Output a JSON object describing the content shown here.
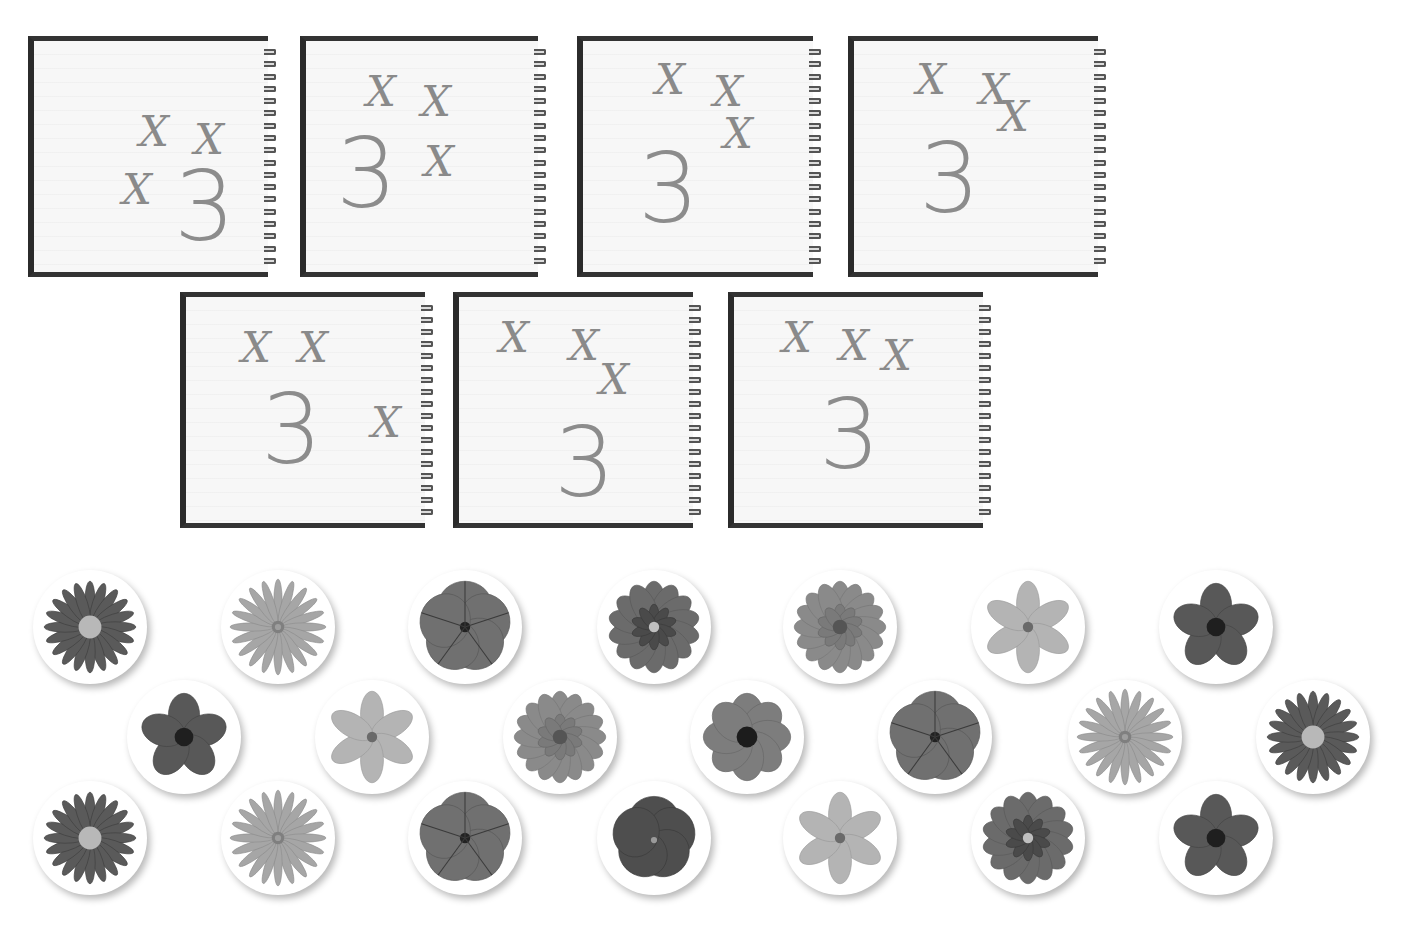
{
  "notebooks": [
    {
      "id": 1,
      "tally": 3,
      "number": "3",
      "marks": [
        {
          "x": 105,
          "y": 70
        },
        {
          "x": 160,
          "y": 78
        },
        {
          "x": 88,
          "y": 128
        }
      ],
      "three": {
        "x": 140,
        "y": 118
      }
    },
    {
      "id": 2,
      "tally": 3,
      "number": "3",
      "marks": [
        {
          "x": 60,
          "y": 30
        },
        {
          "x": 115,
          "y": 40
        },
        {
          "x": 118,
          "y": 100
        }
      ],
      "three": {
        "x": 30,
        "y": 85
      }
    },
    {
      "id": 3,
      "tally": 3,
      "number": "3",
      "marks": [
        {
          "x": 72,
          "y": 18
        },
        {
          "x": 130,
          "y": 30
        },
        {
          "x": 140,
          "y": 72
        }
      ],
      "three": {
        "x": 55,
        "y": 100
      }
    },
    {
      "id": 4,
      "tally": 3,
      "number": "3",
      "marks": [
        {
          "x": 62,
          "y": 18
        },
        {
          "x": 125,
          "y": 28
        },
        {
          "x": 145,
          "y": 55
        }
      ],
      "three": {
        "x": 65,
        "y": 90
      }
    },
    {
      "id": 5,
      "tally": 3,
      "number": "3",
      "marks": [
        {
          "x": 55,
          "y": 30
        },
        {
          "x": 112,
          "y": 30
        },
        {
          "x": 185,
          "y": 105
        }
      ],
      "three": {
        "x": 75,
        "y": 85
      }
    },
    {
      "id": 6,
      "tally": 3,
      "number": "3",
      "marks": [
        {
          "x": 40,
          "y": 20
        },
        {
          "x": 110,
          "y": 28
        },
        {
          "x": 140,
          "y": 62
        }
      ],
      "three": {
        "x": 95,
        "y": 118
      }
    },
    {
      "id": 7,
      "tally": 3,
      "number": "3",
      "marks": [
        {
          "x": 48,
          "y": 20
        },
        {
          "x": 105,
          "y": 28
        },
        {
          "x": 148,
          "y": 38
        }
      ],
      "three": {
        "x": 85,
        "y": 90
      }
    }
  ],
  "flowers": {
    "count": 21,
    "rows": [
      [
        "gerbera-dark",
        "daisy-light",
        "petunia",
        "dahlia",
        "zinnia",
        "star-flower-light",
        "anemone-dark"
      ],
      [
        "anemone-dark",
        "star-flower-light",
        "zinnia",
        "anemone-centered",
        "petunia",
        "daisy-light",
        "gerbera-dark"
      ],
      [
        "gerbera-dark",
        "daisy-light",
        "petunia",
        "pansy",
        "star-flower-light",
        "dahlia",
        "anemone-dark"
      ]
    ]
  },
  "colors": {
    "ink": "#8a8a8a",
    "notebook_border": "#2b2b2b",
    "paper": "#f7f7f7",
    "background": "#ffffff"
  }
}
